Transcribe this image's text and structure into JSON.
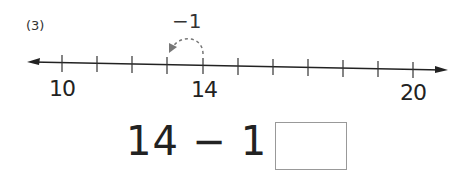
{
  "problem": {
    "number": "(3)",
    "operation_label": "−1",
    "equation": "14 − 1 =",
    "answer": ""
  },
  "number_line": {
    "start": 10,
    "end": 20,
    "labels": [
      {
        "value": "10",
        "x": 62
      },
      {
        "value": "14",
        "x": 203
      },
      {
        "value": "20",
        "x": 413
      }
    ],
    "ticks_x": [
      62,
      97,
      132,
      167,
      203,
      238,
      273,
      308,
      343,
      378,
      413
    ],
    "hop": {
      "from": 14,
      "to": 13,
      "style": "dashed"
    }
  }
}
